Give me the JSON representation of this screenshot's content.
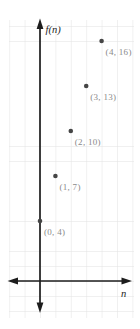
{
  "axes": {
    "y_label": "f(n)",
    "x_label": "n"
  },
  "colors": {
    "background": "#ffffff",
    "axis": "#1d1d1d",
    "grid": "#e2e2e2",
    "point": "#454545",
    "point_label": "#8a8a8a"
  },
  "chart_data": {
    "type": "scatter",
    "title": "",
    "xlabel": "n",
    "ylabel": "f(n)",
    "x": [
      0,
      1,
      2,
      3,
      4
    ],
    "y": [
      4,
      7,
      10,
      13,
      16
    ],
    "points": [
      {
        "n": 0,
        "fn": 4,
        "label": "(0, 4)"
      },
      {
        "n": 1,
        "fn": 7,
        "label": "(1, 7)"
      },
      {
        "n": 2,
        "fn": 10,
        "label": "(2, 10)"
      },
      {
        "n": 3,
        "fn": 13,
        "label": "(3, 13)"
      },
      {
        "n": 4,
        "fn": 16,
        "label": "(4, 16)"
      }
    ],
    "grid": true,
    "grid_unit": 1,
    "xlim": [
      -2,
      6
    ],
    "ylim": [
      -2.5,
      17.5
    ],
    "legend": false
  }
}
